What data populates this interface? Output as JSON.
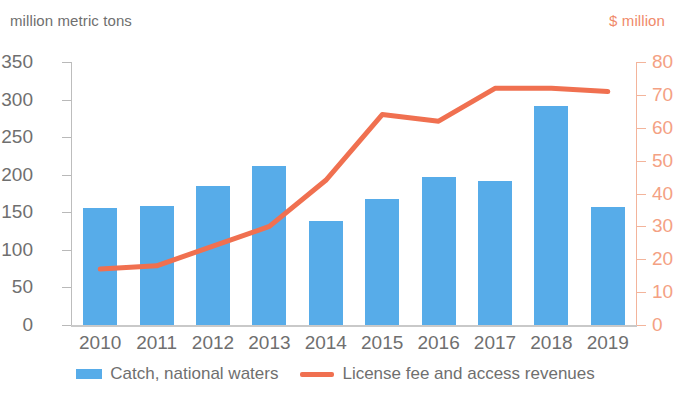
{
  "axis_caption_left": "million metric tons",
  "axis_caption_right": "$ million",
  "legend": {
    "bar_label": "Catch, national waters",
    "line_label": "License fee and access revenues"
  },
  "colors": {
    "bar": "#57ace9",
    "line": "#f07050",
    "left_axis_text": "#6f6f6f",
    "right_axis_text": "#f4a183"
  },
  "chart_data": {
    "type": "bar",
    "title": "",
    "xlabel": "",
    "ylabel": "million metric tons",
    "y2label": "$ million",
    "categories": [
      "2010",
      "2011",
      "2012",
      "2013",
      "2014",
      "2015",
      "2016",
      "2017",
      "2018",
      "2019"
    ],
    "ylim": [
      0,
      350
    ],
    "y_ticks": [
      0,
      50,
      100,
      150,
      200,
      250,
      300,
      350
    ],
    "y2lim": [
      0,
      80
    ],
    "y2_ticks": [
      0,
      10,
      20,
      30,
      40,
      50,
      60,
      70,
      80
    ],
    "grid": false,
    "legend_position": "bottom",
    "series": [
      {
        "name": "Catch, national waters",
        "type": "bar",
        "axis": "left",
        "unit": "million metric tons",
        "color": "#57ace9",
        "values": [
          156,
          158,
          185,
          212,
          139,
          168,
          197,
          191,
          291,
          157
        ]
      },
      {
        "name": "License fee and access revenues",
        "type": "line",
        "axis": "right",
        "unit": "$ million",
        "color": "#f07050",
        "values": [
          17,
          18,
          24,
          30,
          44,
          64,
          62,
          72,
          72,
          71
        ]
      }
    ]
  }
}
